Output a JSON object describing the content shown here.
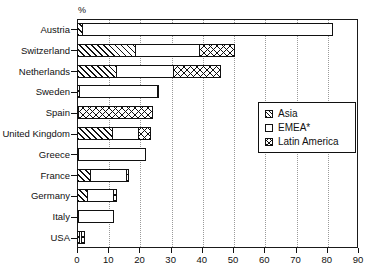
{
  "chart_data": {
    "type": "bar",
    "orientation": "horizontal",
    "stacked": true,
    "title": "",
    "subtitle": "",
    "xlabel": "",
    "ylabel": "",
    "unit_label": "%",
    "xlim": [
      0,
      90
    ],
    "xticks": [
      0,
      10,
      20,
      30,
      40,
      50,
      60,
      70,
      80,
      90
    ],
    "xtick_labels": [
      "0",
      "10",
      "20",
      "30",
      "40",
      "50",
      "60",
      "70",
      "80",
      "90"
    ],
    "grid": "vertical-dotted",
    "legend_position": "center-right",
    "categories": [
      "Austria",
      "Switzerland",
      "Netherlands",
      "Sweden",
      "Spain",
      "United Kingdom",
      "Greece",
      "France",
      "Germany",
      "Italy",
      "USA"
    ],
    "series": [
      {
        "name": "Asia",
        "pattern": "diagonal-hatch",
        "values": [
          2.0,
          19.0,
          13.0,
          1.0,
          0.6,
          11.5,
          0.7,
          4.5,
          3.5,
          0.4,
          1.2
        ]
      },
      {
        "name": "EMEA*",
        "pattern": "solid-white",
        "values": [
          80.5,
          21.0,
          18.5,
          25.5,
          0.4,
          9.0,
          21.8,
          12.0,
          9.0,
          11.6,
          0.8
        ]
      },
      {
        "name": "Latin America",
        "pattern": "cross-hatch",
        "values": [
          0.0,
          11.5,
          15.5,
          0.7,
          24.0,
          4.0,
          0.0,
          1.0,
          1.0,
          0.0,
          1.5
        ]
      }
    ],
    "totals": [
      82.5,
      51.5,
      47.0,
      27.2,
      25.0,
      24.5,
      22.5,
      17.5,
      13.5,
      12.0,
      3.5
    ]
  },
  "legend": {
    "items": [
      {
        "label": "Asia",
        "key": "asia"
      },
      {
        "label": "EMEA*",
        "key": "emea"
      },
      {
        "label": "Latin America",
        "key": "latam"
      }
    ]
  },
  "colors": {
    "ink": "#111111",
    "grid": "#9a9a9a",
    "background": "#ffffff"
  }
}
